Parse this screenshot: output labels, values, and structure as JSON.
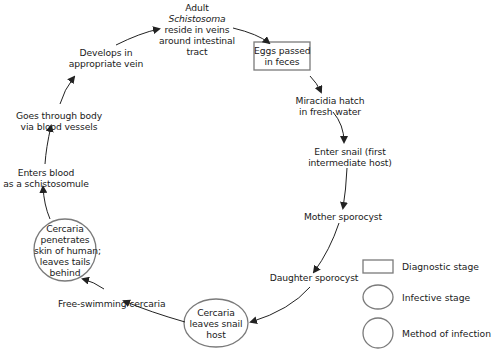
{
  "diagram": {
    "stages": [
      {
        "id": "adult",
        "lines": [
          "Adult",
          "Schistosoma",
          "reside in veins",
          "around intestinal",
          "tract"
        ],
        "italic_line": 1,
        "shape": "none"
      },
      {
        "id": "eggs",
        "lines": [
          "Eggs passed",
          "in feces"
        ],
        "shape": "rectangle"
      },
      {
        "id": "miracidia",
        "lines": [
          "Miracidia hatch",
          "in fresh water"
        ],
        "shape": "none"
      },
      {
        "id": "enter-snail",
        "lines": [
          "Enter snail (first",
          "intermediate host)"
        ],
        "shape": "none"
      },
      {
        "id": "mother-sporocyst",
        "lines": [
          "Mother sporocyst"
        ],
        "shape": "none"
      },
      {
        "id": "daughter-sporocyst",
        "lines": [
          "Daughter sporocyst"
        ],
        "shape": "none"
      },
      {
        "id": "cercaria-leaves",
        "lines": [
          "Cercaria",
          "leaves snail",
          "host"
        ],
        "shape": "ellipse"
      },
      {
        "id": "free-swimming",
        "lines": [
          "Free-swimming cercaria"
        ],
        "shape": "none"
      },
      {
        "id": "cercaria-penetrates",
        "lines": [
          "Cercaria",
          "penetrates",
          "skin of human;",
          "leaves tails",
          "behind"
        ],
        "shape": "circle"
      },
      {
        "id": "enters-blood",
        "lines": [
          "Enters blood",
          "as a schistosomule"
        ],
        "shape": "none"
      },
      {
        "id": "goes-through",
        "lines": [
          "Goes through body",
          "via blood vessels"
        ],
        "shape": "none"
      },
      {
        "id": "develops",
        "lines": [
          "Develops in",
          "appropriate vein"
        ],
        "shape": "none"
      }
    ],
    "legend": [
      {
        "shape": "rectangle",
        "label": "Diagnostic stage"
      },
      {
        "shape": "ellipse",
        "label": "Infective stage"
      },
      {
        "shape": "circle",
        "label": "Method of infection"
      }
    ],
    "colors": {
      "stroke": "#7a7a7a",
      "text": "#1a1a1a",
      "arrow": "#222222"
    }
  }
}
